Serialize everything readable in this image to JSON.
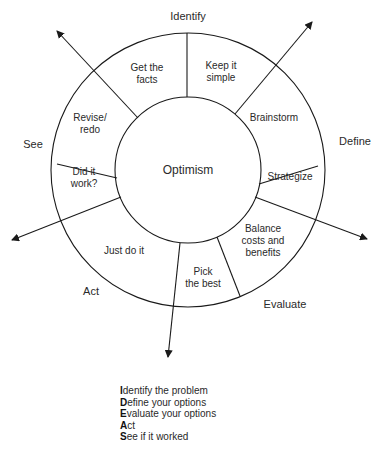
{
  "diagram": {
    "center_label": "Optimism",
    "stages": [
      {
        "key": "identify",
        "label": "Identify"
      },
      {
        "key": "define",
        "label": "Define"
      },
      {
        "key": "evaluate",
        "label": "Evaluate"
      },
      {
        "key": "act",
        "label": "Act"
      },
      {
        "key": "see",
        "label": "See"
      }
    ],
    "segments": [
      {
        "label": "Get the facts",
        "lines": [
          "Get the",
          "facts"
        ]
      },
      {
        "label": "Keep it simple",
        "lines": [
          "Keep it",
          "simple"
        ]
      },
      {
        "label": "Brainstorm",
        "lines": [
          "Brainstorm"
        ]
      },
      {
        "label": "Strategize",
        "lines": [
          "Strategize"
        ]
      },
      {
        "label": "Balance costs and benefits",
        "lines": [
          "Balance",
          "costs and",
          "benefits"
        ]
      },
      {
        "label": "Pick the best",
        "lines": [
          "Pick",
          "the best"
        ]
      },
      {
        "label": "Just do it",
        "lines": [
          "Just do it"
        ]
      },
      {
        "label": "Did it work?",
        "lines": [
          "Did it",
          "work?"
        ]
      },
      {
        "label": "Revise/redo",
        "lines": [
          "Revise/",
          "redo"
        ]
      }
    ],
    "legend": [
      {
        "initial": "I",
        "rest": "dentify the problem"
      },
      {
        "initial": "D",
        "rest": "efine your options"
      },
      {
        "initial": "E",
        "rest": "valuate your options"
      },
      {
        "initial": "A",
        "rest": "ct"
      },
      {
        "initial": "S",
        "rest": "ee if it worked"
      }
    ],
    "colors": {
      "line": "#1a1a1a",
      "text": "#2a2a2a",
      "background": "#ffffff"
    }
  }
}
